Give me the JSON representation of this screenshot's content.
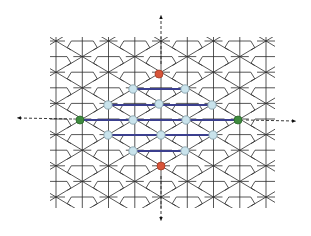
{
  "diagram": {
    "colors": {
      "tiling_stroke": "#2b2b2b",
      "bond": "#3b3f8e",
      "node_fill": "#c9e3ec",
      "node_stroke": "#7f99a3",
      "red_node": "#d8553a",
      "green_node": "#3e8a3e",
      "axis": "#222222"
    },
    "tiling_bounds": {
      "left": 50,
      "top": 37,
      "right": 275,
      "bottom": 208
    },
    "axes": [
      {
        "name": "axis-up",
        "x1": 161,
        "y1": 64,
        "x2": 161,
        "y2": 17
      },
      {
        "name": "axis-down",
        "x1": 161,
        "y1": 176,
        "x2": 161,
        "y2": 219
      },
      {
        "name": "axis-left",
        "x1": 72,
        "y1": 119,
        "x2": 19,
        "y2": 118
      },
      {
        "name": "axis-right",
        "x1": 246,
        "y1": 120,
        "x2": 294,
        "y2": 121
      }
    ],
    "bonds": [
      {
        "x1": 133,
        "y1": 89,
        "x2": 185,
        "y2": 89
      },
      {
        "x1": 108,
        "y1": 105,
        "x2": 212,
        "y2": 105
      },
      {
        "x1": 80,
        "y1": 120,
        "x2": 238,
        "y2": 120
      },
      {
        "x1": 108,
        "y1": 135,
        "x2": 213,
        "y2": 135
      },
      {
        "x1": 133,
        "y1": 151,
        "x2": 185,
        "y2": 151
      }
    ],
    "nodes": [
      {
        "type": "red",
        "x": 159,
        "y": 74
      },
      {
        "type": "blue",
        "x": 133,
        "y": 89
      },
      {
        "type": "blue",
        "x": 185,
        "y": 89
      },
      {
        "type": "blue",
        "x": 108,
        "y": 105
      },
      {
        "type": "blue",
        "x": 159,
        "y": 104
      },
      {
        "type": "blue",
        "x": 212,
        "y": 105
      },
      {
        "type": "green",
        "x": 80,
        "y": 120
      },
      {
        "type": "blue",
        "x": 133,
        "y": 120
      },
      {
        "type": "blue",
        "x": 186,
        "y": 120
      },
      {
        "type": "green",
        "x": 238,
        "y": 120
      },
      {
        "type": "blue",
        "x": 108,
        "y": 135
      },
      {
        "type": "blue",
        "x": 161,
        "y": 135
      },
      {
        "type": "blue",
        "x": 213,
        "y": 135
      },
      {
        "type": "blue",
        "x": 133,
        "y": 151
      },
      {
        "type": "blue",
        "x": 185,
        "y": 151
      },
      {
        "type": "red",
        "x": 161,
        "y": 166
      }
    ]
  }
}
